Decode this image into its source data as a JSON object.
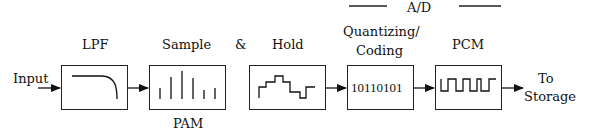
{
  "diagram": {
    "header": {
      "label": "A/D"
    },
    "input_label": "Input",
    "output_label_line1": "To",
    "output_label_line2": "Storage",
    "blocks": [
      {
        "id": "lpf",
        "title": "LPF",
        "icon": "lowpass-response-icon"
      },
      {
        "id": "sample",
        "title": "Sample",
        "sublabel": "PAM",
        "icon": "sampled-pulses-icon"
      },
      {
        "id": "hold",
        "title": "Hold",
        "icon": "staircase-waveform-icon"
      },
      {
        "id": "quantize",
        "title_line1": "Quantizing/",
        "title_line2": "Coding",
        "content": "10110101"
      },
      {
        "id": "pcm",
        "title": "PCM",
        "icon": "square-wave-icon"
      }
    ],
    "connector": "&"
  }
}
